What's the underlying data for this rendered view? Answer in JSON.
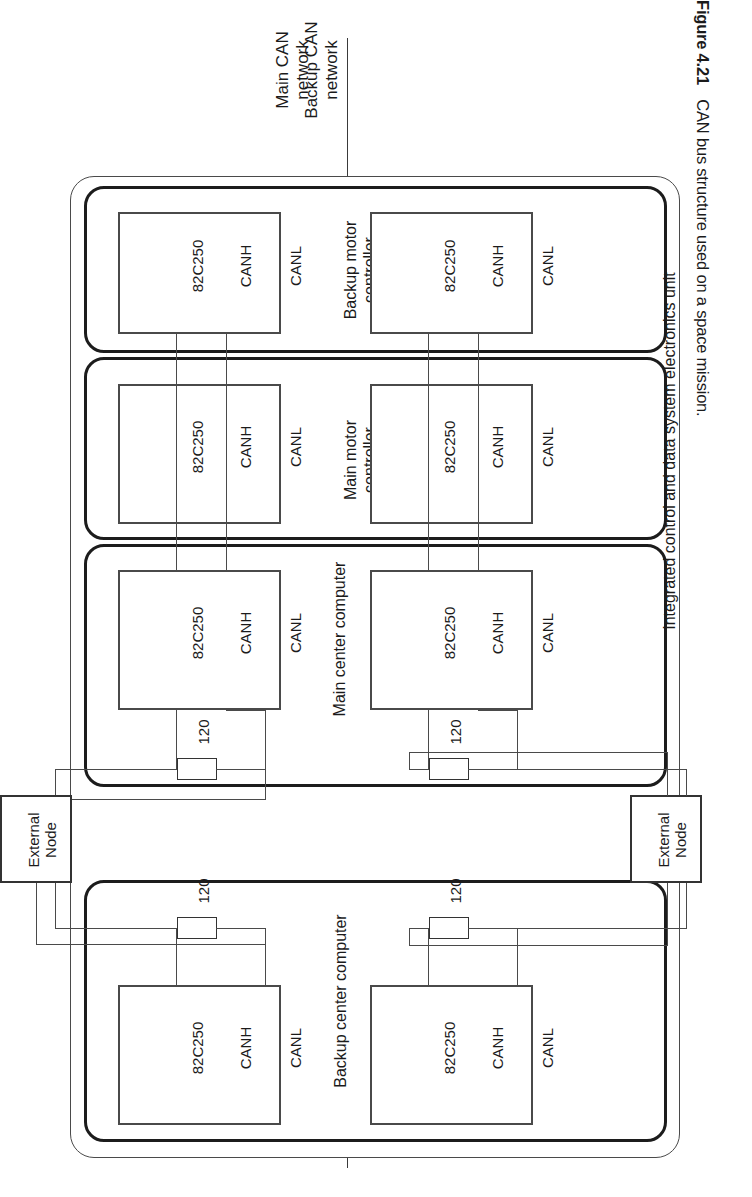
{
  "figure": {
    "number": "Figure 4.21",
    "caption": "CAN bus structure used on a space mission."
  },
  "networks": [
    {
      "id": "main",
      "label": "Main CAN\nnetwork"
    },
    {
      "id": "backup",
      "label": "Backup CAN\nnetwork"
    }
  ],
  "unit": {
    "label": "Integrated control and data system electronics unit"
  },
  "subsystems": [
    {
      "id": "backup-center-computer",
      "label": "Backup center computer",
      "has_terminator": true
    },
    {
      "id": "main-center-computer",
      "label": "Main center computer",
      "has_terminator": true
    },
    {
      "id": "main-motor-controller",
      "label": "Main motor\ncontroller",
      "has_terminator": false
    },
    {
      "id": "backup-motor-controller",
      "label": "Backup motor\ncontroller",
      "has_terminator": false
    }
  ],
  "transceiver": {
    "part": "82C250",
    "pin_high": "CANH",
    "pin_low": "CANL"
  },
  "terminator": {
    "value": "120"
  },
  "external_nodes": [
    {
      "id": "external-node-main",
      "label": "External\nNode"
    },
    {
      "id": "external-node-backup",
      "label": "External\nNode"
    }
  ],
  "colors": {
    "line": "#3a3a3a",
    "heavy_line": "#1a1a1a",
    "background": "#ffffff",
    "text": "#1b1b1b"
  }
}
